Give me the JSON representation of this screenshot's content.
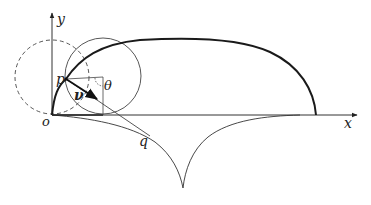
{
  "diagram": {
    "type": "geometric-construction",
    "labels": {
      "x_axis": "x",
      "y_axis": "y",
      "origin": "o",
      "point_p": "p",
      "point_q": "q",
      "angle": "θ",
      "vector": "ν"
    },
    "elements": [
      {
        "name": "x-axis",
        "kind": "arrow"
      },
      {
        "name": "y-axis",
        "kind": "arrow"
      },
      {
        "name": "dashed-circle",
        "kind": "circle",
        "style": "dashed"
      },
      {
        "name": "rolling-circle",
        "kind": "circle",
        "style": "solid"
      },
      {
        "name": "upper-curve",
        "kind": "curve",
        "style": "bold"
      },
      {
        "name": "lower-cusp-curve",
        "kind": "curve",
        "style": "thin"
      },
      {
        "name": "tangent-line-pq",
        "kind": "line"
      },
      {
        "name": "velocity-vector",
        "kind": "arrow"
      },
      {
        "name": "angle-theta-marker",
        "kind": "arc"
      }
    ],
    "colors": {
      "stroke": "#222222",
      "background": "#ffffff"
    }
  }
}
